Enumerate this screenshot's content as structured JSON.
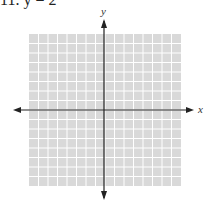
{
  "header": {
    "cut_off_text": "11. y = 2"
  },
  "chart_data": {
    "type": "scatter",
    "title": "",
    "xlabel": "x",
    "ylabel": "y",
    "grid": true,
    "grid_cells_x": 16,
    "grid_cells_y": 16,
    "xlim": [
      -8,
      8
    ],
    "ylim": [
      -8,
      8
    ],
    "series": [],
    "colors": {
      "grid_fill": "#d9d9d9",
      "grid_lines": "#ffffff",
      "axes": "#222222"
    }
  },
  "axes": {
    "x_label": "x",
    "y_label": "y"
  }
}
